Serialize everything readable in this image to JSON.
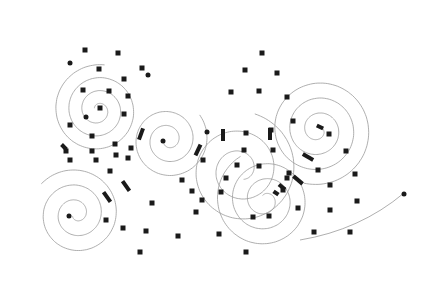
{
  "diagram": {
    "width": 428,
    "height": 300,
    "background": "#ffffff",
    "stroke_color": "#9a9a9a",
    "node_color": "#1a1a1a",
    "spirals": [
      {
        "name": "top-left-spiral",
        "cx": 98,
        "cy": 110,
        "turns": 3.2,
        "start_r": 4,
        "growth": 13,
        "start_angle": 3.6,
        "dir": 1
      },
      {
        "name": "center-spiral",
        "cx": 168,
        "cy": 140,
        "turns": 2.6,
        "start_r": 4,
        "growth": 14,
        "start_angle": 3.1,
        "dir": -1
      },
      {
        "name": "right-spiral",
        "cx": 318,
        "cy": 130,
        "turns": 3.4,
        "start_r": 4,
        "growth": 15,
        "start_angle": 5.6,
        "dir": 1
      },
      {
        "name": "bottom-left-spiral",
        "cx": 76,
        "cy": 214,
        "turns": 2.8,
        "start_r": 4,
        "growth": 15,
        "start_angle": 2.6,
        "dir": -1
      },
      {
        "name": "lower-middle-spiral",
        "cx": 265,
        "cy": 200,
        "turns": 3.0,
        "start_r": 5,
        "growth": 15,
        "start_angle": 4.2,
        "dir": 1
      },
      {
        "name": "mid-right-arc-spiral",
        "cx": 240,
        "cy": 170,
        "turns": 2.4,
        "start_r": 10,
        "growth": 20,
        "start_angle": 1.2,
        "dir": -1
      }
    ],
    "tail_curve": {
      "name": "right-tail",
      "d": "M 300 240 Q 360 230 404 193"
    },
    "dots": [
      {
        "x": 70,
        "y": 63
      },
      {
        "x": 148,
        "y": 75
      },
      {
        "x": 86,
        "y": 117
      },
      {
        "x": 163,
        "y": 141
      },
      {
        "x": 207,
        "y": 132
      },
      {
        "x": 69,
        "y": 216
      },
      {
        "x": 404,
        "y": 194
      }
    ],
    "nodes": [
      {
        "x": 85,
        "y": 50
      },
      {
        "x": 118,
        "y": 53
      },
      {
        "x": 99,
        "y": 69
      },
      {
        "x": 142,
        "y": 68
      },
      {
        "x": 124,
        "y": 79
      },
      {
        "x": 83,
        "y": 90
      },
      {
        "x": 109,
        "y": 91
      },
      {
        "x": 100,
        "y": 108
      },
      {
        "x": 124,
        "y": 114
      },
      {
        "x": 70,
        "y": 125
      },
      {
        "x": 92,
        "y": 136
      },
      {
        "x": 115,
        "y": 144
      },
      {
        "x": 66,
        "y": 151
      },
      {
        "x": 92,
        "y": 151
      },
      {
        "x": 116,
        "y": 155
      },
      {
        "x": 70,
        "y": 160
      },
      {
        "x": 96,
        "y": 160
      },
      {
        "x": 110,
        "y": 171
      },
      {
        "x": 128,
        "y": 158
      },
      {
        "x": 152,
        "y": 203
      },
      {
        "x": 106,
        "y": 220
      },
      {
        "x": 123,
        "y": 228
      },
      {
        "x": 140,
        "y": 252
      },
      {
        "x": 262,
        "y": 53
      },
      {
        "x": 245,
        "y": 70
      },
      {
        "x": 277,
        "y": 73
      },
      {
        "x": 231,
        "y": 92
      },
      {
        "x": 259,
        "y": 91
      },
      {
        "x": 287,
        "y": 97
      },
      {
        "x": 293,
        "y": 121
      },
      {
        "x": 271,
        "y": 130
      },
      {
        "x": 246,
        "y": 133
      },
      {
        "x": 329,
        "y": 134
      },
      {
        "x": 346,
        "y": 151
      },
      {
        "x": 355,
        "y": 174
      },
      {
        "x": 357,
        "y": 201
      },
      {
        "x": 244,
        "y": 150
      },
      {
        "x": 273,
        "y": 150
      },
      {
        "x": 289,
        "y": 173
      },
      {
        "x": 287,
        "y": 178
      },
      {
        "x": 330,
        "y": 185
      },
      {
        "x": 330,
        "y": 210
      },
      {
        "x": 314,
        "y": 232
      },
      {
        "x": 350,
        "y": 232
      },
      {
        "x": 298,
        "y": 208
      },
      {
        "x": 269,
        "y": 216
      },
      {
        "x": 253,
        "y": 217
      },
      {
        "x": 237,
        "y": 165
      },
      {
        "x": 226,
        "y": 178
      },
      {
        "x": 221,
        "y": 192
      },
      {
        "x": 202,
        "y": 200
      },
      {
        "x": 196,
        "y": 212
      },
      {
        "x": 182,
        "y": 180
      },
      {
        "x": 178,
        "y": 236
      },
      {
        "x": 219,
        "y": 234
      },
      {
        "x": 246,
        "y": 252
      },
      {
        "x": 203,
        "y": 160
      },
      {
        "x": 146,
        "y": 231
      },
      {
        "x": 259,
        "y": 166
      },
      {
        "x": 283,
        "y": 190
      },
      {
        "x": 192,
        "y": 191
      },
      {
        "x": 131,
        "y": 148
      },
      {
        "x": 128,
        "y": 96
      },
      {
        "x": 318,
        "y": 170
      }
    ],
    "bars": [
      {
        "x": 141,
        "y": 134,
        "angle": -70,
        "len": 12
      },
      {
        "x": 198,
        "y": 150,
        "angle": -65,
        "len": 12
      },
      {
        "x": 223,
        "y": 135,
        "angle": 90,
        "len": 12
      },
      {
        "x": 270,
        "y": 134,
        "angle": 90,
        "len": 12
      },
      {
        "x": 126,
        "y": 186,
        "angle": 55,
        "len": 12
      },
      {
        "x": 107,
        "y": 197,
        "angle": 55,
        "len": 12
      },
      {
        "x": 308,
        "y": 157,
        "angle": 30,
        "len": 12
      },
      {
        "x": 298,
        "y": 180,
        "angle": 40,
        "len": 12
      },
      {
        "x": 282,
        "y": 187,
        "angle": 40,
        "len": 8
      },
      {
        "x": 64,
        "y": 147,
        "angle": 45,
        "len": 7
      },
      {
        "x": 320,
        "y": 127,
        "angle": 25,
        "len": 7
      },
      {
        "x": 276,
        "y": 193,
        "angle": 35,
        "len": 6
      }
    ]
  }
}
